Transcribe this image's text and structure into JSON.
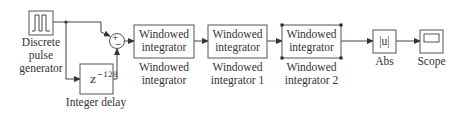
{
  "diagram": {
    "type": "simulink-block-diagram",
    "blocks": {
      "pulse": {
        "label_lines": [
          "Discrete",
          "pulse",
          "generator"
        ],
        "icon": "pulse-waveform-icon"
      },
      "delay": {
        "content": "z",
        "exponent": "−128",
        "label": "Integer delay"
      },
      "sum": {
        "signs": [
          "+",
          "−"
        ]
      },
      "int0": {
        "content_lines": [
          "Windowed",
          "integrator"
        ],
        "label_lines": [
          "Windowed",
          "integrator"
        ]
      },
      "int1": {
        "content_lines": [
          "Windowed",
          "integrator"
        ],
        "label_lines": [
          "Windowed",
          "integrator 1"
        ]
      },
      "int2": {
        "content_lines": [
          "Windowed",
          "integrator"
        ],
        "label_lines": [
          "Windowed",
          "integrator 2"
        ],
        "selected": true
      },
      "abs": {
        "content": "|u|",
        "label": "Abs"
      },
      "scope": {
        "label": "Scope",
        "icon": "scope-screen-icon"
      }
    },
    "connections": [
      [
        "pulse",
        "sum+"
      ],
      [
        "pulse",
        "delay"
      ],
      [
        "delay",
        "sum−"
      ],
      [
        "sum",
        "int0"
      ],
      [
        "int0",
        "int1"
      ],
      [
        "int1",
        "int2"
      ],
      [
        "int2",
        "abs"
      ],
      [
        "abs",
        "scope"
      ]
    ]
  }
}
